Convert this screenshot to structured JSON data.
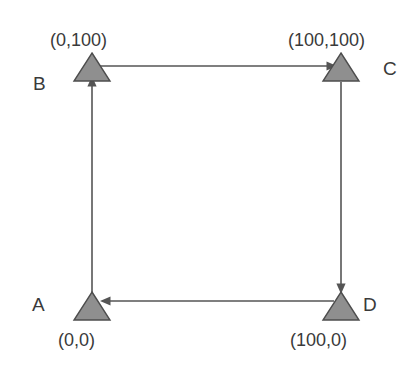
{
  "diagram": {
    "background_color": "#ffffff",
    "node_fill_color": "#8f8f8f",
    "node_stroke_color": "#4d4d4d",
    "arrow_color": "#555555",
    "text_color": "#3a3a3a",
    "nodes": [
      {
        "id": "A",
        "label": "A",
        "coordinate_label": "(0,0)",
        "shape": "triangle",
        "x": 92,
        "y": 308,
        "label_position": "left",
        "coordinate_position": "below"
      },
      {
        "id": "B",
        "label": "B",
        "coordinate_label": "(0,100)",
        "shape": "triangle",
        "x": 92,
        "y": 72,
        "label_position": "left",
        "coordinate_position": "above"
      },
      {
        "id": "C",
        "label": "C",
        "coordinate_label": "(100,100)",
        "shape": "triangle",
        "x": 341,
        "y": 72,
        "label_position": "right",
        "coordinate_position": "above"
      },
      {
        "id": "D",
        "label": "D",
        "coordinate_label": "(100,0)",
        "shape": "triangle",
        "x": 341,
        "y": 308,
        "label_position": "right",
        "coordinate_position": "below"
      }
    ],
    "edges": [
      {
        "id": "A-to-B",
        "from": "A",
        "to": "B",
        "direction": "up",
        "arrowhead": "at-target"
      },
      {
        "id": "B-to-C",
        "from": "B",
        "to": "C",
        "direction": "right",
        "arrowhead": "at-target"
      },
      {
        "id": "C-to-D",
        "from": "C",
        "to": "D",
        "direction": "down",
        "arrowhead": "at-target"
      },
      {
        "id": "D-to-A",
        "from": "D",
        "to": "A",
        "direction": "left",
        "arrowhead": "at-target"
      }
    ]
  },
  "labels": {
    "node_a": "A",
    "node_b": "B",
    "node_c": "C",
    "node_d": "D",
    "coord_a": "(0,0)",
    "coord_b": "(0,100)",
    "coord_c": "(100,100)",
    "coord_d": "(100,0)"
  }
}
